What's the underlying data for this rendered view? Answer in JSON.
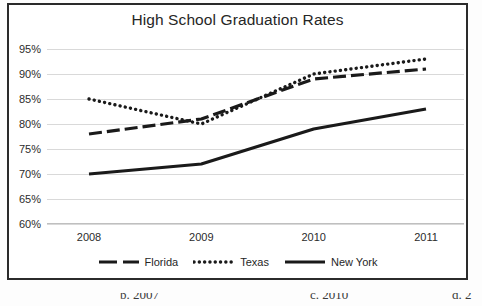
{
  "chart_data": {
    "type": "line",
    "title": "High School Graduation Rates",
    "xlabel": "",
    "ylabel": "",
    "categories": [
      "2008",
      "2009",
      "2010",
      "2011"
    ],
    "x": [
      2008,
      2009,
      2010,
      2011
    ],
    "ylim": [
      60,
      95
    ],
    "yticks": [
      "60%",
      "65%",
      "70%",
      "75%",
      "80%",
      "85%",
      "90%",
      "95%"
    ],
    "ytick_values": [
      60,
      65,
      70,
      75,
      80,
      85,
      90,
      95
    ],
    "grid": true,
    "legend_position": "bottom",
    "series": [
      {
        "name": "Florida",
        "style": "dashed",
        "color": "#1a1a1a",
        "values": [
          78,
          81,
          89,
          91
        ]
      },
      {
        "name": "Texas",
        "style": "dotted",
        "color": "#1a1a1a",
        "values": [
          85,
          80,
          90,
          93
        ]
      },
      {
        "name": "New York",
        "style": "solid",
        "color": "#1a1a1a",
        "values": [
          70,
          72,
          79,
          83
        ]
      }
    ]
  },
  "page_fragments": {
    "choice_b": "b. 2007",
    "choice_c": "c. 2010",
    "choice_d": "d. 2"
  }
}
